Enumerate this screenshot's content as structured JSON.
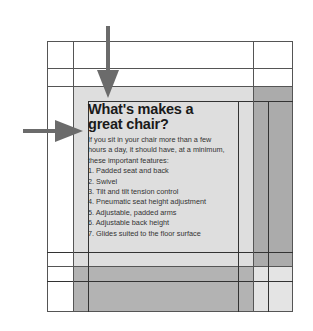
{
  "diagram": {
    "type": "layout-grid-illustration",
    "heading": {
      "line1": "What's makes a",
      "line2": "great chair?"
    },
    "intro": {
      "line1": "If you sit in your chair more than a few",
      "line2": "hours a day, it should have, at a minimum,",
      "line3": "these important features:"
    },
    "features": [
      "1. Padded seat and back",
      "2. Swivel",
      "3. Tilt and tilt tension control",
      "4. Pneumatic seat height adjustment",
      "5. Adjustable, padded arms",
      "6. Adjustable back height",
      "7. Glides suited to the floor surface"
    ],
    "arrows": [
      {
        "direction": "down",
        "points_to": "heading-top-edge"
      },
      {
        "direction": "right",
        "points_to": "text-left-edge"
      }
    ],
    "colors": {
      "light_shade": "#dcdcdc",
      "mid_shade": "#b4b4b4",
      "dark_shade": "#a8a8a8",
      "arrow": "#6b6b6b",
      "grid_line": "#555555"
    }
  }
}
